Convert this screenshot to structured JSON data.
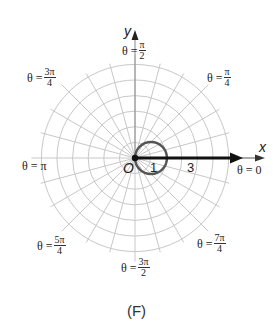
{
  "figure": {
    "caption": "(F)",
    "axis_labels": {
      "x": "x",
      "y": "y"
    },
    "origin_label": "O",
    "tick_labels": {
      "one": "1",
      "three": "3"
    },
    "angle_labels": {
      "zero": {
        "prefix": "θ = ",
        "value": "0"
      },
      "pi_over_4": {
        "prefix": "θ =",
        "num": "π",
        "den": "4"
      },
      "pi_over_2": {
        "prefix": "θ =",
        "num": "π",
        "den": "2"
      },
      "three_pi_4": {
        "prefix": "θ =",
        "num": "3π",
        "den": "4"
      },
      "pi": {
        "prefix": "θ = ",
        "value": "π"
      },
      "five_pi_4": {
        "prefix": "θ =",
        "num": "5π",
        "den": "4"
      },
      "three_pi_2": {
        "prefix": "θ =",
        "num": "3π",
        "den": "2"
      },
      "seven_pi_4": {
        "prefix": "θ =",
        "num": "7π",
        "den": "4"
      }
    },
    "colors": {
      "grid": "#c8c8c8",
      "curve": "#555555",
      "arrow": "#111111",
      "text": "#222222"
    }
  },
  "chart_data": {
    "type": "polar",
    "title": "(F)",
    "grid": {
      "rings": [
        1,
        2,
        3,
        4,
        5,
        6
      ],
      "spokes_deg_step": 15
    },
    "curve": {
      "description": "circle r = 2cos(θ)",
      "center": [
        1,
        0
      ],
      "radius": 1
    },
    "ray": {
      "description": "ray θ = 0 from origin",
      "from": [
        0,
        0
      ],
      "to_r": 6.8
    },
    "axis_tick_labels": [
      "1",
      "3"
    ],
    "angle_labels": [
      "θ = 0",
      "θ = π/4",
      "θ = π/2",
      "θ = 3π/4",
      "θ = π",
      "θ = 5π/4",
      "θ = 3π/2",
      "θ = 7π/4"
    ]
  }
}
